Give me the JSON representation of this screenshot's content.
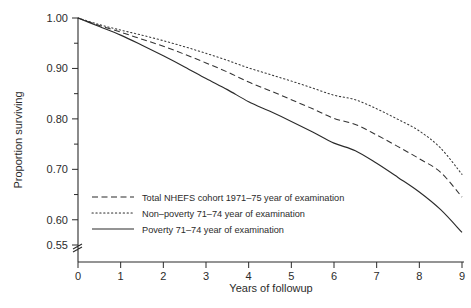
{
  "chart_data": {
    "type": "line",
    "title": "",
    "xlabel": "Years of followup",
    "ylabel": "Proportion surviving",
    "xlim": [
      0,
      9
    ],
    "ylim": [
      0.55,
      1.0
    ],
    "xticks": [
      0,
      1,
      2,
      3,
      4,
      5,
      6,
      7,
      8,
      9
    ],
    "xtick_labels": [
      "0",
      "1",
      "2",
      "3",
      "4",
      "5",
      "6",
      "7",
      "8",
      "9"
    ],
    "yticks": [
      0.55,
      0.6,
      0.65,
      0.7,
      0.75,
      0.8,
      0.85,
      0.9,
      0.95,
      1.0
    ],
    "ytick_labels_major": [
      "1.00",
      "0.90",
      "0.80",
      "0.70",
      "0.60",
      "0.55"
    ],
    "ytick_major_values": [
      1.0,
      0.9,
      0.8,
      0.7,
      0.6,
      0.55
    ],
    "grid": false,
    "axis_break": true,
    "legend_position": "lower-left-inside",
    "x": [
      0,
      0.5,
      1,
      1.5,
      2,
      2.5,
      3,
      3.5,
      4,
      4.5,
      5,
      5.5,
      6,
      6.5,
      7,
      7.5,
      8,
      8.5,
      9
    ],
    "series": [
      {
        "name": "Total NHEFS cohort 1971-75 year of examination",
        "style": "dashed",
        "color": "#333333",
        "values": [
          1.0,
          0.985,
          0.972,
          0.958,
          0.944,
          0.928,
          0.911,
          0.893,
          0.873,
          0.856,
          0.838,
          0.82,
          0.801,
          0.789,
          0.768,
          0.745,
          0.721,
          0.694,
          0.645
        ]
      },
      {
        "name": "Non-poverty 71-74 year of examination",
        "style": "dotted",
        "color": "#3a3a3a",
        "values": [
          1.0,
          0.987,
          0.976,
          0.966,
          0.955,
          0.943,
          0.93,
          0.916,
          0.901,
          0.888,
          0.875,
          0.861,
          0.847,
          0.838,
          0.82,
          0.799,
          0.776,
          0.742,
          0.69
        ]
      },
      {
        "name": "Poverty 71-74 year of examination",
        "style": "solid",
        "color": "#2b2b2b",
        "values": [
          1.0,
          0.983,
          0.966,
          0.946,
          0.925,
          0.903,
          0.88,
          0.858,
          0.834,
          0.815,
          0.795,
          0.774,
          0.752,
          0.737,
          0.712,
          0.684,
          0.655,
          0.62,
          0.575
        ]
      }
    ]
  },
  "legend": {
    "entries": [
      {
        "label": "Total NHEFS cohort 1971–75 year of examination",
        "style": "dashed"
      },
      {
        "label": "Non–poverty 71–74 year of examination",
        "style": "dotted"
      },
      {
        "label": "Poverty 71–74 year of examination",
        "style": "solid"
      }
    ]
  },
  "axes": {
    "y_title": "Proportion surviving",
    "x_title": "Years of followup",
    "y_labels": [
      "1.00",
      "0.90",
      "0.80",
      "0.70",
      "0.60",
      "0.55"
    ],
    "x_labels": [
      "0",
      "1",
      "2",
      "3",
      "4",
      "5",
      "6",
      "7",
      "8",
      "9"
    ]
  }
}
